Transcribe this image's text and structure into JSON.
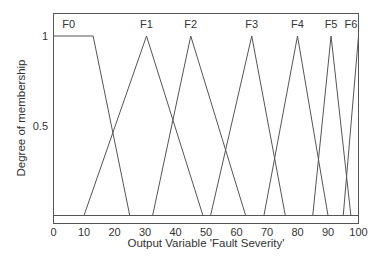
{
  "chart_data": {
    "type": "line",
    "title": "",
    "xlabel": "Output Variable 'Fault Severity'",
    "ylabel": "Degree of membership",
    "xlim": [
      0,
      100
    ],
    "ylim": [
      0,
      1
    ],
    "xticks": [
      0,
      10,
      20,
      30,
      40,
      50,
      60,
      70,
      80,
      90,
      100
    ],
    "yticks": [
      {
        "value": 0.5,
        "label": "0.5"
      },
      {
        "value": 1,
        "label": "1"
      }
    ],
    "grid": false,
    "legend": "none",
    "series": [
      {
        "name": "F0",
        "shape": "trapezoid",
        "x": [
          0,
          13,
          25
        ],
        "y": [
          1,
          1,
          0
        ]
      },
      {
        "name": "F1",
        "shape": "triangle",
        "x": [
          10,
          30.5,
          49
        ],
        "y": [
          0,
          1,
          0
        ]
      },
      {
        "name": "F2",
        "shape": "triangle",
        "x": [
          32.5,
          45,
          63
        ],
        "y": [
          0,
          1,
          0
        ]
      },
      {
        "name": "F3",
        "shape": "triangle",
        "x": [
          51.5,
          65,
          76
        ],
        "y": [
          0,
          1,
          0
        ]
      },
      {
        "name": "F4",
        "shape": "triangle",
        "x": [
          69,
          80,
          90
        ],
        "y": [
          0,
          1,
          0
        ]
      },
      {
        "name": "F5",
        "shape": "triangle",
        "x": [
          85,
          91,
          97.5
        ],
        "y": [
          0,
          1,
          0
        ]
      },
      {
        "name": "F6",
        "shape": "triangle",
        "x": [
          95,
          100
        ],
        "y": [
          0,
          1
        ]
      }
    ],
    "labels": [
      {
        "text": "F0",
        "x": 5
      },
      {
        "text": "F1",
        "x": 30.5
      },
      {
        "text": "F2",
        "x": 45
      },
      {
        "text": "F3",
        "x": 65
      },
      {
        "text": "F4",
        "x": 80
      },
      {
        "text": "F5",
        "x": 91
      },
      {
        "text": "F6",
        "x": 97.5
      }
    ]
  }
}
